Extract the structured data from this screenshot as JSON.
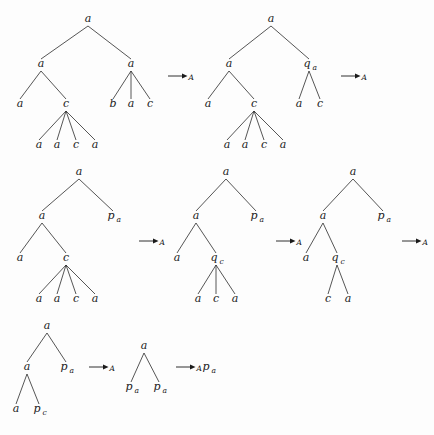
{
  "figure": {
    "ink_color": "#1a1a1a",
    "background_color": "#fdfdfd",
    "arrow_symbol": "→",
    "arrow_subscript": "A"
  },
  "rows": [
    {
      "id": "row-1",
      "trees": [
        {
          "id": "row1-tree1",
          "nodes": [
            {
              "id": "r1t1-n0",
              "label": "a",
              "sub": "",
              "x": 88,
              "y": 22
            },
            {
              "id": "r1t1-n1",
              "label": "a",
              "sub": "",
              "x": 41,
              "y": 67
            },
            {
              "id": "r1t1-n2",
              "label": "a",
              "sub": "",
              "x": 131,
              "y": 67
            },
            {
              "id": "r1t1-n3",
              "label": "a",
              "sub": "",
              "x": 20,
              "y": 107
            },
            {
              "id": "r1t1-n4",
              "label": "c",
              "sub": "",
              "x": 66,
              "y": 107
            },
            {
              "id": "r1t1-n5",
              "label": "b",
              "sub": "",
              "x": 113,
              "y": 107
            },
            {
              "id": "r1t1-n6",
              "label": "a",
              "sub": "",
              "x": 131,
              "y": 107
            },
            {
              "id": "r1t1-n7",
              "label": "c",
              "sub": "",
              "x": 150,
              "y": 107
            },
            {
              "id": "r1t1-n8",
              "label": "a",
              "sub": "",
              "x": 39,
              "y": 148
            },
            {
              "id": "r1t1-n9",
              "label": "a",
              "sub": "",
              "x": 57,
              "y": 148
            },
            {
              "id": "r1t1-n10",
              "label": "c",
              "sub": "",
              "x": 76,
              "y": 148
            },
            {
              "id": "r1t1-n11",
              "label": "a",
              "sub": "",
              "x": 95,
              "y": 148
            }
          ],
          "edges": [
            [
              0,
              1
            ],
            [
              0,
              2
            ],
            [
              1,
              3
            ],
            [
              1,
              4
            ],
            [
              2,
              5
            ],
            [
              2,
              6
            ],
            [
              2,
              7
            ],
            [
              4,
              8
            ],
            [
              4,
              9
            ],
            [
              4,
              10
            ],
            [
              4,
              11
            ]
          ]
        },
        {
          "id": "row1-tree2",
          "nodes": [
            {
              "id": "r1t2-n0",
              "label": "a",
              "sub": "",
              "x": 271,
              "y": 22
            },
            {
              "id": "r1t2-n1",
              "label": "a",
              "sub": "",
              "x": 229,
              "y": 67
            },
            {
              "id": "r1t2-n2",
              "label": "q",
              "sub": "a",
              "x": 309,
              "y": 67
            },
            {
              "id": "r1t2-n3",
              "label": "a",
              "sub": "",
              "x": 208,
              "y": 107
            },
            {
              "id": "r1t2-n4",
              "label": "c",
              "sub": "",
              "x": 254,
              "y": 107
            },
            {
              "id": "r1t2-n5",
              "label": "a",
              "sub": "",
              "x": 299,
              "y": 107
            },
            {
              "id": "r1t2-n6",
              "label": "c",
              "sub": "",
              "x": 320,
              "y": 107
            },
            {
              "id": "r1t2-n7",
              "label": "a",
              "sub": "",
              "x": 227,
              "y": 148
            },
            {
              "id": "r1t2-n8",
              "label": "a",
              "sub": "",
              "x": 245,
              "y": 148
            },
            {
              "id": "r1t2-n9",
              "label": "c",
              "sub": "",
              "x": 264,
              "y": 148
            },
            {
              "id": "r1t2-n10",
              "label": "a",
              "sub": "",
              "x": 283,
              "y": 148
            }
          ],
          "edges": [
            [
              0,
              1
            ],
            [
              0,
              2
            ],
            [
              1,
              3
            ],
            [
              1,
              4
            ],
            [
              2,
              5
            ],
            [
              2,
              6
            ],
            [
              4,
              7
            ],
            [
              4,
              8
            ],
            [
              4,
              9
            ],
            [
              4,
              10
            ]
          ]
        }
      ],
      "arrows": [
        {
          "id": "row1-arrow1",
          "x": 168,
          "y": 76
        },
        {
          "id": "row1-arrow2",
          "x": 341,
          "y": 76
        }
      ]
    },
    {
      "id": "row-2",
      "trees": [
        {
          "id": "row2-tree1",
          "nodes": [
            {
              "id": "r2t1-n0",
              "label": "a",
              "sub": "",
              "x": 79,
              "y": 175
            },
            {
              "id": "r2t1-n1",
              "label": "a",
              "sub": "",
              "x": 42,
              "y": 219
            },
            {
              "id": "r2t1-n2",
              "label": "p",
              "sub": "a",
              "x": 113,
              "y": 219
            },
            {
              "id": "r2t1-n3",
              "label": "a",
              "sub": "",
              "x": 20,
              "y": 261
            },
            {
              "id": "r2t1-n4",
              "label": "c",
              "sub": "",
              "x": 66,
              "y": 261
            },
            {
              "id": "r2t1-n5",
              "label": "a",
              "sub": "",
              "x": 39,
              "y": 302
            },
            {
              "id": "r2t1-n6",
              "label": "a",
              "sub": "",
              "x": 57,
              "y": 302
            },
            {
              "id": "r2t1-n7",
              "label": "c",
              "sub": "",
              "x": 76,
              "y": 302
            },
            {
              "id": "r2t1-n8",
              "label": "a",
              "sub": "",
              "x": 95,
              "y": 302
            }
          ],
          "edges": [
            [
              0,
              1
            ],
            [
              0,
              2
            ],
            [
              1,
              3
            ],
            [
              1,
              4
            ],
            [
              4,
              5
            ],
            [
              4,
              6
            ],
            [
              4,
              7
            ],
            [
              4,
              8
            ]
          ]
        },
        {
          "id": "row2-tree2",
          "nodes": [
            {
              "id": "r2t2-n0",
              "label": "a",
              "sub": "",
              "x": 226,
              "y": 175
            },
            {
              "id": "r2t2-n1",
              "label": "a",
              "sub": "",
              "x": 196,
              "y": 219
            },
            {
              "id": "r2t2-n2",
              "label": "p",
              "sub": "a",
              "x": 256,
              "y": 219
            },
            {
              "id": "r2t2-n3",
              "label": "a",
              "sub": "",
              "x": 177,
              "y": 261
            },
            {
              "id": "r2t2-n4",
              "label": "q",
              "sub": "c",
              "x": 216,
              "y": 261
            },
            {
              "id": "r2t2-n5",
              "label": "a",
              "sub": "",
              "x": 198,
              "y": 302
            },
            {
              "id": "r2t2-n6",
              "label": "c",
              "sub": "",
              "x": 216,
              "y": 302
            },
            {
              "id": "r2t2-n7",
              "label": "a",
              "sub": "",
              "x": 235,
              "y": 302
            }
          ],
          "edges": [
            [
              0,
              1
            ],
            [
              0,
              2
            ],
            [
              1,
              3
            ],
            [
              1,
              4
            ],
            [
              4,
              5
            ],
            [
              4,
              6
            ],
            [
              4,
              7
            ]
          ]
        },
        {
          "id": "row2-tree3",
          "nodes": [
            {
              "id": "r2t3-n0",
              "label": "a",
              "sub": "",
              "x": 353,
              "y": 175
            },
            {
              "id": "r2t3-n1",
              "label": "a",
              "sub": "",
              "x": 323,
              "y": 219
            },
            {
              "id": "r2t3-n2",
              "label": "p",
              "sub": "a",
              "x": 383,
              "y": 219
            },
            {
              "id": "r2t3-n3",
              "label": "a",
              "sub": "",
              "x": 306,
              "y": 261
            },
            {
              "id": "r2t3-n4",
              "label": "q",
              "sub": "c",
              "x": 337,
              "y": 261
            },
            {
              "id": "r2t3-n5",
              "label": "c",
              "sub": "",
              "x": 328,
              "y": 302
            },
            {
              "id": "r2t3-n6",
              "label": "a",
              "sub": "",
              "x": 348,
              "y": 302
            }
          ],
          "edges": [
            [
              0,
              1
            ],
            [
              0,
              2
            ],
            [
              1,
              3
            ],
            [
              1,
              4
            ],
            [
              4,
              5
            ],
            [
              4,
              6
            ]
          ]
        }
      ],
      "arrows": [
        {
          "id": "row2-arrow1",
          "x": 139,
          "y": 241
        },
        {
          "id": "row2-arrow2",
          "x": 276,
          "y": 241
        },
        {
          "id": "row2-arrow3",
          "x": 402,
          "y": 241
        }
      ]
    },
    {
      "id": "row-3",
      "trees": [
        {
          "id": "row3-tree1",
          "nodes": [
            {
              "id": "r3t1-n0",
              "label": "a",
              "sub": "",
              "x": 47,
              "y": 329
            },
            {
              "id": "r3t1-n1",
              "label": "a",
              "sub": "",
              "x": 27,
              "y": 370
            },
            {
              "id": "r3t1-n2",
              "label": "p",
              "sub": "a",
              "x": 66,
              "y": 370
            },
            {
              "id": "r3t1-n3",
              "label": "a",
              "sub": "",
              "x": 16,
              "y": 412
            },
            {
              "id": "r3t1-n4",
              "label": "p",
              "sub": "c",
              "x": 39,
              "y": 412
            }
          ],
          "edges": [
            [
              0,
              1
            ],
            [
              0,
              2
            ],
            [
              1,
              3
            ],
            [
              1,
              4
            ]
          ]
        },
        {
          "id": "row3-tree2",
          "nodes": [
            {
              "id": "r3t2-n0",
              "label": "a",
              "sub": "",
              "x": 144,
              "y": 349
            },
            {
              "id": "r3t2-n1",
              "label": "p",
              "sub": "a",
              "x": 131,
              "y": 390
            },
            {
              "id": "r3t2-n2",
              "label": "p",
              "sub": "a",
              "x": 159,
              "y": 390
            }
          ],
          "edges": [
            [
              0,
              1
            ],
            [
              0,
              2
            ]
          ]
        },
        {
          "id": "row3-tree3",
          "nodes": [
            {
              "id": "r3t3-n0",
              "label": "p",
              "sub": "a",
              "x": 208,
              "y": 370
            }
          ],
          "edges": []
        }
      ],
      "arrows": [
        {
          "id": "row3-arrow1",
          "x": 89,
          "y": 367
        },
        {
          "id": "row3-arrow2",
          "x": 176,
          "y": 367
        }
      ]
    }
  ]
}
